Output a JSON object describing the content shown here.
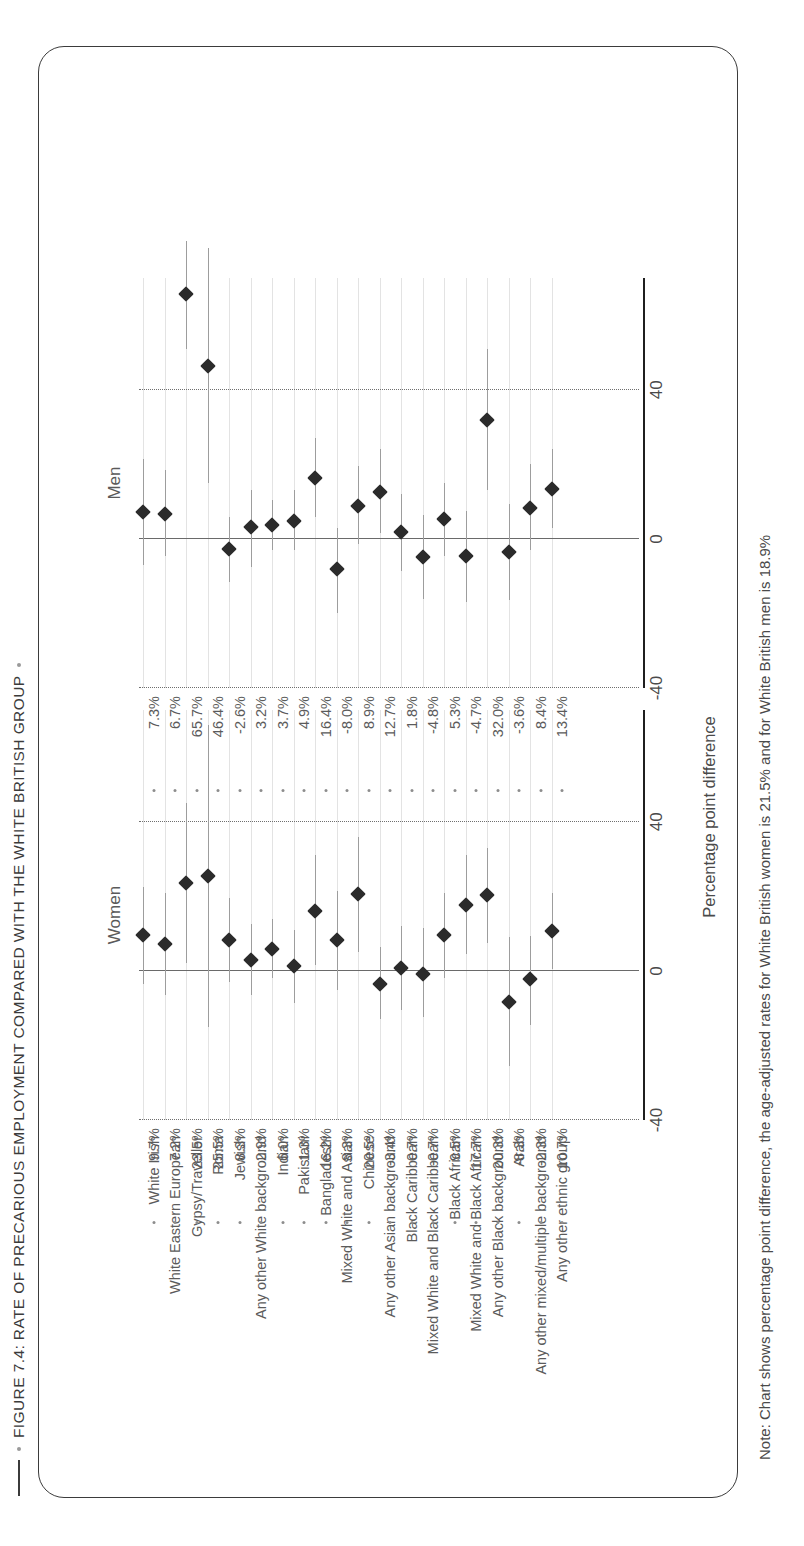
{
  "figure": {
    "title": "FIGURE 7.4: RATE OF PRECARIOUS EMPLOYMENT COMPARED WITH THE WHITE BRITISH GROUP",
    "note": "Note: Chart shows percentage point difference, the age-adjusted rates for White British women is 21.5% and for White British men is 18.9%",
    "axis_title": "Percentage point difference",
    "panel_women": "Women",
    "panel_men": "Men",
    "accent_marker": "#2b2b2b",
    "accent_whisker": "#9d9d9d",
    "frame_color": "#3b3b3b"
  },
  "chart_data": {
    "type": "scatter",
    "title": "FIGURE 7.4: RATE OF PRECARIOUS EMPLOYMENT COMPARED WITH THE WHITE BRITISH GROUP",
    "subtitle": "",
    "xlabel": "Percentage point difference",
    "ylabel": "",
    "xlim": [
      -40,
      70
    ],
    "xticks": [
      -40,
      0,
      40
    ],
    "xtick_labels": [
      "-40",
      "0",
      "40"
    ],
    "grid": "dotted vertical gridlines at -40 and 40; solid reference line at 0",
    "legend": "none",
    "panels": [
      "Women",
      "Men"
    ],
    "categories": [
      "White Irish",
      "White Eastern European",
      "Gypsy/Traveller",
      "Roma",
      "Jewish",
      "Any other White background",
      "Indian",
      "Pakistani",
      "Bangladeshi",
      "Mixed White and Asian",
      "Chinese",
      "Any other Asian background",
      "Black Caribbean",
      "Mixed White and Black Caribbean",
      "Black African",
      "Mixed White and Black African",
      "Any other Black background",
      "Arab",
      "Any other mixed/multiple background",
      "Any other ethnic group"
    ],
    "series": [
      {
        "name": "Women",
        "values": [
          9.7,
          7.2,
          23.5,
          25.5,
          8.3,
          2.9,
          6.0,
          1.3,
          16.2,
          8.3,
          20.5,
          -3.4,
          0.7,
          -0.7,
          9.5,
          17.7,
          20.3,
          -8.3,
          -2.3,
          10.7
        ],
        "labels": [
          "9.7%",
          "7.2%",
          "23.5%",
          "25.5%",
          "8.3%",
          "2.9%",
          "6.0%",
          "1.3%",
          "16.2%",
          "8.3%",
          "20.5%",
          "-3.4%",
          "0.7%",
          "-0.7%",
          "9.5%",
          "17.7%",
          "20.3%",
          "-8.3%",
          "-2.3%",
          "10.7%"
        ],
        "ci_low": [
          -3.5,
          -6.5,
          2.0,
          -15.0,
          -3.0,
          -6.5,
          -2.0,
          -8.5,
          1.5,
          -5.0,
          5.0,
          -13.0,
          -10.5,
          -12.5,
          -2.0,
          4.5,
          7.5,
          -25.5,
          -14.5,
          0.5
        ],
        "ci_high": [
          22.5,
          21.0,
          45.0,
          66.0,
          19.5,
          12.5,
          14.0,
          11.0,
          31.0,
          21.5,
          36.0,
          6.5,
          12.0,
          11.5,
          21.0,
          31.0,
          33.0,
          9.0,
          9.5,
          21.0
        ]
      },
      {
        "name": "Men",
        "values": [
          7.3,
          6.7,
          65.7,
          46.4,
          -2.6,
          3.2,
          3.7,
          4.9,
          16.4,
          -8.0,
          8.9,
          12.7,
          1.8,
          -4.8,
          5.3,
          -4.7,
          32.0,
          -3.6,
          8.4,
          13.4
        ],
        "labels": [
          "7.3%",
          "6.7%",
          "65.7%",
          "46.4%",
          "-2.6%",
          "3.2%",
          "3.7%",
          "4.9%",
          "16.4%",
          "-8.0%",
          "8.9%",
          "12.7%",
          "1.8%",
          "-4.8%",
          "5.3%",
          "-4.7%",
          "32.0%",
          "-3.6%",
          "8.4%",
          "13.4%"
        ],
        "ci_low": [
          -7.0,
          -4.5,
          51.0,
          15.0,
          -11.5,
          -7.5,
          -3.0,
          -3.0,
          6.0,
          -20.0,
          -1.5,
          1.5,
          -8.5,
          -16.0,
          -4.5,
          -17.0,
          13.0,
          -16.5,
          -3.0,
          3.0
        ],
        "ci_high": [
          21.5,
          18.5,
          80.0,
          78.0,
          6.0,
          13.0,
          10.5,
          13.0,
          27.0,
          3.0,
          19.5,
          24.0,
          12.0,
          6.5,
          15.0,
          7.5,
          51.0,
          9.5,
          20.0,
          24.0
        ]
      }
    ]
  }
}
